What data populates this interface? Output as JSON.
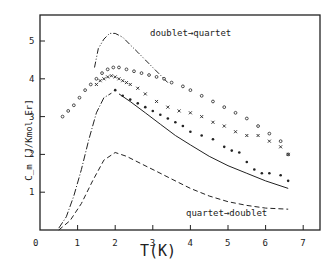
{
  "chart_data": {
    "type": "scatter",
    "title": "",
    "xlabel": "T(K)",
    "ylabel": "C_m [J/Kmol Er]",
    "xlim": [
      0,
      7.4
    ],
    "ylim": [
      0,
      5.5
    ],
    "grid": false,
    "xticks": [
      "0",
      "1",
      "2",
      "3",
      "4",
      "5",
      "6",
      "7"
    ],
    "yticks": [
      "1",
      "2",
      "3",
      "4",
      "5"
    ],
    "annotations": [
      {
        "text": "doublet→quartet",
        "x": 3.0,
        "y": 5.1
      },
      {
        "text": "quartet→doublet",
        "x": 4.0,
        "y": 0.45
      }
    ],
    "series": [
      {
        "name": "doublet→quartet (calc)",
        "style": "dash-dot-dot",
        "x": [
          1.45,
          1.55,
          1.7,
          1.85,
          2.0,
          2.2,
          2.4,
          2.6,
          2.8,
          3.0,
          3.2,
          3.4
        ],
        "y": [
          4.3,
          4.8,
          5.05,
          5.2,
          5.2,
          5.1,
          4.9,
          4.7,
          4.5,
          4.3,
          4.1,
          3.9
        ]
      },
      {
        "name": "open circles (exp)",
        "style": "open-circle",
        "x": [
          0.6,
          0.75,
          0.9,
          1.05,
          1.2,
          1.35,
          1.5,
          1.65,
          1.8,
          1.95,
          2.1,
          2.3,
          2.5,
          2.7,
          2.9,
          3.1,
          3.3,
          3.5,
          3.8,
          4.0,
          4.3,
          4.6,
          4.9,
          5.2,
          5.5,
          5.8,
          6.1,
          6.4,
          6.6
        ],
        "y": [
          3.0,
          3.15,
          3.3,
          3.5,
          3.7,
          3.85,
          4.0,
          4.15,
          4.25,
          4.3,
          4.3,
          4.25,
          4.2,
          4.15,
          4.1,
          4.05,
          4.0,
          3.9,
          3.8,
          3.7,
          3.55,
          3.4,
          3.25,
          3.1,
          2.95,
          2.75,
          2.55,
          2.35,
          2.0
        ]
      },
      {
        "name": "crosses (exp)",
        "style": "cross",
        "x": [
          1.5,
          1.6,
          1.7,
          1.8,
          1.9,
          2.0,
          2.1,
          2.2,
          2.3,
          2.4,
          2.6,
          2.8,
          3.1,
          3.4,
          3.7,
          4.0,
          4.3,
          4.6,
          4.9,
          5.2,
          5.5,
          5.8,
          6.1,
          6.4,
          6.6
        ],
        "y": [
          3.85,
          3.95,
          4.0,
          4.05,
          4.08,
          4.05,
          4.0,
          3.95,
          3.9,
          3.85,
          3.75,
          3.6,
          3.4,
          3.25,
          3.15,
          3.1,
          3.0,
          2.85,
          2.75,
          2.6,
          2.5,
          2.5,
          2.35,
          2.2,
          2.0
        ]
      },
      {
        "name": "filled dots (exp)",
        "style": "dot",
        "x": [
          2.0,
          2.2,
          2.4,
          2.6,
          2.8,
          3.0,
          3.2,
          3.4,
          3.6,
          3.8,
          4.0,
          4.3,
          4.6,
          4.9,
          5.1,
          5.3,
          5.5,
          5.7,
          5.9,
          6.1,
          6.4,
          6.6
        ],
        "y": [
          3.7,
          3.55,
          3.45,
          3.35,
          3.25,
          3.15,
          3.05,
          2.95,
          2.85,
          2.75,
          2.6,
          2.5,
          2.4,
          2.2,
          2.1,
          2.05,
          1.8,
          1.6,
          1.5,
          1.5,
          1.45,
          1.3
        ]
      },
      {
        "name": "solid/dash-dot (calc)",
        "style": "dash-dot",
        "x": [
          0.5,
          0.7,
          0.9,
          1.1,
          1.3,
          1.5,
          1.7,
          1.9,
          2.1,
          2.4,
          2.8,
          3.2,
          3.6,
          4.0,
          4.5,
          5.0,
          5.5,
          6.0,
          6.6
        ],
        "y": [
          0.05,
          0.35,
          0.9,
          1.6,
          2.4,
          3.1,
          3.5,
          3.62,
          3.6,
          3.4,
          3.1,
          2.8,
          2.5,
          2.25,
          1.95,
          1.7,
          1.5,
          1.3,
          1.1
        ]
      },
      {
        "name": "quartet→doublet (calc)",
        "style": "dashed",
        "x": [
          0.5,
          0.8,
          1.1,
          1.4,
          1.7,
          2.0,
          2.3,
          2.7,
          3.1,
          3.5,
          4.0,
          4.5,
          5.0,
          5.5,
          6.0,
          6.6
        ],
        "y": [
          0.0,
          0.25,
          0.7,
          1.3,
          1.85,
          2.05,
          1.95,
          1.75,
          1.55,
          1.35,
          1.1,
          0.9,
          0.75,
          0.65,
          0.58,
          0.55
        ]
      }
    ]
  },
  "labels": {
    "ylabel": "C_m [J/Kmol Er]",
    "xlabel": "T(K)",
    "annotation_top": "doublet→quartet",
    "annotation_bottom": "quartet→doublet",
    "origin": "0"
  },
  "colors": {
    "ink": "#222222",
    "background": "#ffffff"
  }
}
